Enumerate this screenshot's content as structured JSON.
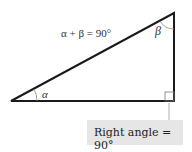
{
  "diagram": {
    "equation": "α + β = 90°",
    "angle_labels": {
      "alpha": "α",
      "beta": "β"
    },
    "callout": "Right angle = 90°",
    "colors": {
      "line": "#1a1a1a",
      "arc": "#777777",
      "callout_bg": "#e6e6e6"
    }
  }
}
